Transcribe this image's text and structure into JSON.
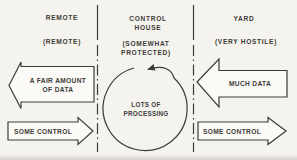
{
  "diagram": {
    "zones": [
      {
        "title": "REMOTE",
        "condition": "(REMOTE)"
      },
      {
        "title_line1": "CONTROL",
        "title_line2": "HOUSE",
        "condition_line1": "(SOMEWHAT",
        "condition_line2": "PROTECTED)"
      },
      {
        "title": "YARD",
        "condition": "(VERY HOSTILE)"
      }
    ],
    "flows": [
      {
        "label_line1": "A FAIR AMOUNT",
        "label_line2": "OF DATA",
        "direction": "left",
        "zone": "REMOTE"
      },
      {
        "label": "SOME CONTROL",
        "direction": "right",
        "zone": "REMOTE"
      },
      {
        "label": "MUCH DATA",
        "direction": "left",
        "zone": "YARD"
      },
      {
        "label": "SOME CONTROL",
        "direction": "right",
        "zone": "YARD"
      }
    ],
    "process": {
      "line1": "LOTS OF",
      "line2": "PROCESSING"
    }
  },
  "colors": {
    "ink": "#3e3c38",
    "paper": "#f5f3ee",
    "fill": "#fbfaf6"
  }
}
